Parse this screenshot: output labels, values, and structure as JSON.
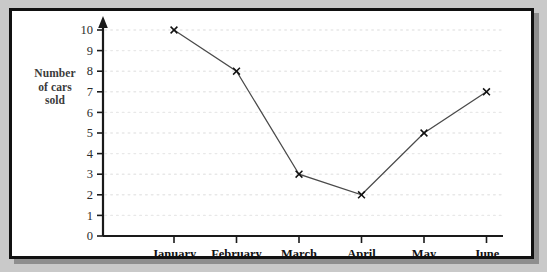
{
  "chart_data": {
    "type": "line",
    "title": "",
    "subtitle": "",
    "xlabel": "",
    "ylabel": "Number of cars sold",
    "ylabel_lines": [
      "Number",
      "of cars",
      "sold"
    ],
    "categories": [
      "January",
      "February",
      "March",
      "April",
      "May",
      "June"
    ],
    "values": [
      10,
      8,
      3,
      2,
      5,
      7
    ],
    "series": [
      {
        "name": "Number of cars sold",
        "values": [
          10,
          8,
          3,
          2,
          5,
          7
        ]
      }
    ],
    "ylim": [
      0,
      10
    ],
    "ytick_labels": [
      "0",
      "1",
      "2",
      "3",
      "4",
      "5",
      "6",
      "7",
      "8",
      "9",
      "10"
    ],
    "ytick_values": [
      0,
      1,
      2,
      3,
      4,
      5,
      6,
      7,
      8,
      9,
      10
    ],
    "grid": "horizontal-dotted",
    "legend": "none",
    "marker": "x-cross",
    "line_color": "#4a4a4a",
    "marker_color": "#111111",
    "grid_color": "#e8e8e8",
    "axis_color": "#1a1a1a",
    "y_axis_arrow": true,
    "annotations": []
  },
  "frame": {
    "border_color": "#111111",
    "background_color": "#ffffff",
    "page_background_color": "#c9c9c9",
    "shadow_color": "#8e8e8e"
  }
}
